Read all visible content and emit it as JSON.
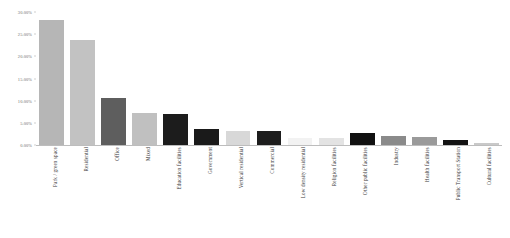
{
  "chart_data": {
    "type": "bar",
    "title": "",
    "xlabel": "",
    "ylabel": "",
    "ylim": [
      0,
      30
    ],
    "grid": false,
    "legend": null,
    "yticks": [
      "0.00%",
      "5.00%",
      "10.00%",
      "15.00%",
      "20.00%",
      "25.00%",
      "30.00%"
    ],
    "ytick_values": [
      0,
      5,
      10,
      15,
      20,
      25,
      30
    ],
    "y_unit": "%",
    "categories": [
      "Park / green space",
      "Residential",
      "Office",
      "Mixed",
      "Education facilities",
      "Government",
      "Vertical residential",
      "Commercial",
      "Low density residential",
      "Religion facilities",
      "Other public facilities",
      "Industry",
      "Health facilities",
      "Public Transport Station",
      "Cultural facilities"
    ],
    "values": [
      28.3,
      23.8,
      10.6,
      7.3,
      7.0,
      3.6,
      3.2,
      3.1,
      1.6,
      1.5,
      2.6,
      2.0,
      1.9,
      1.1,
      0.5
    ],
    "colors": [
      "#b6b6b6",
      "#c2c2c2",
      "#5e5e5e",
      "#c0c0c0",
      "#1c1c1c",
      "#1a1a1a",
      "#d8d8d8",
      "#1d1d1d",
      "#f2f2f2",
      "#e3e3e3",
      "#111111",
      "#8a8a8a",
      "#9a9a9a",
      "#121212",
      "#c9c9c9"
    ]
  }
}
